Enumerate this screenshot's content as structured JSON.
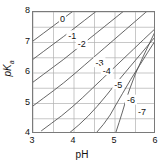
{
  "chart_data": {
    "type": "line",
    "title": "",
    "xlabel": "pH",
    "ylabel": "pKa",
    "ylabel_main": "pK",
    "ylabel_sub": "a",
    "xlim": [
      3,
      6
    ],
    "ylim": [
      4,
      8
    ],
    "xticks": [
      3,
      4,
      5,
      6
    ],
    "yticks": [
      4,
      5,
      6,
      7,
      8
    ],
    "xtick_labels": [
      "3",
      "4",
      "5",
      "6"
    ],
    "ytick_labels": [
      "4",
      "5",
      "6",
      "7",
      "8"
    ],
    "grid": true,
    "x_minor_step": 0.5,
    "y_minor_step": 0.5,
    "legend": "none",
    "plot_kind": "contour",
    "contour_labels": [
      "0",
      "-1",
      "-2",
      "-3",
      "-4",
      "-5",
      "-6",
      "-7"
    ],
    "contour_levels": [
      0,
      -1,
      -2,
      -3,
      -4,
      -5,
      -6,
      -7
    ],
    "label_positions": [
      {
        "label": "0",
        "pH": 3.72,
        "pKa": 7.78
      },
      {
        "label": "-1",
        "pH": 3.96,
        "pKa": 7.22
      },
      {
        "label": "-2",
        "pH": 4.19,
        "pKa": 6.94
      },
      {
        "label": "-3",
        "pH": 4.62,
        "pKa": 6.34
      },
      {
        "label": "-4",
        "pH": 4.8,
        "pKa": 6.08
      },
      {
        "label": "-5",
        "pH": 5.08,
        "pKa": 5.62
      },
      {
        "label": "-6",
        "pH": 5.39,
        "pKa": 5.11
      },
      {
        "label": "-7",
        "pH": 5.66,
        "pKa": 4.72
      }
    ],
    "series": [
      {
        "name": "0",
        "x": [
          3.0,
          3.25,
          3.5,
          3.75,
          4.0,
          4.25,
          4.5,
          4.75,
          5.0,
          5.25,
          5.5,
          5.75,
          6.0
        ],
        "y": [
          7.05,
          7.3,
          7.55,
          7.8,
          8.05,
          8.3,
          8.55,
          8.8,
          9.05,
          9.3,
          9.55,
          9.8,
          10.05
        ]
      },
      {
        "name": "-1",
        "x": [
          3.0,
          3.25,
          3.5,
          3.75,
          4.0,
          4.25,
          4.5,
          4.75,
          5.0,
          5.25,
          5.5,
          5.75,
          6.0
        ],
        "y": [
          6.45,
          6.7,
          6.95,
          7.2,
          7.46,
          7.72,
          7.98,
          8.24,
          8.5,
          8.76,
          9.02,
          9.28,
          9.54
        ]
      },
      {
        "name": "-2",
        "x": [
          3.0,
          3.25,
          3.5,
          3.75,
          4.0,
          4.25,
          4.5,
          4.75,
          5.0,
          5.25,
          5.5,
          5.75,
          6.0
        ],
        "y": [
          5.7,
          5.95,
          6.2,
          6.45,
          6.72,
          6.99,
          7.26,
          7.53,
          7.8,
          8.07,
          8.34,
          8.61,
          8.88
        ]
      },
      {
        "name": "-3",
        "x": [
          3.0,
          3.25,
          3.5,
          3.75,
          4.0,
          4.25,
          4.5,
          4.75,
          5.0,
          5.25,
          5.5,
          5.75,
          6.0
        ],
        "y": [
          4.92,
          5.17,
          5.42,
          5.68,
          5.96,
          6.25,
          6.54,
          6.83,
          7.12,
          7.41,
          7.7,
          7.99,
          8.28
        ]
      },
      {
        "name": "-4",
        "x": [
          3.2,
          3.45,
          3.7,
          3.95,
          4.2,
          4.45,
          4.7,
          4.95,
          5.2,
          5.45,
          5.7,
          6.0
        ],
        "y": [
          4.1,
          4.35,
          4.6,
          4.88,
          5.18,
          5.5,
          5.82,
          6.14,
          6.46,
          6.78,
          7.1,
          7.48
        ]
      },
      {
        "name": "-5",
        "x": [
          3.9,
          4.12,
          4.34,
          4.56,
          4.78,
          5.0,
          5.25,
          5.5,
          5.75,
          6.0
        ],
        "y": [
          4.05,
          4.3,
          4.58,
          4.9,
          5.25,
          5.62,
          6.02,
          6.42,
          6.82,
          7.22
        ]
      },
      {
        "name": "-6",
        "x": [
          4.55,
          4.72,
          4.88,
          5.02,
          5.18,
          5.38,
          5.6,
          5.8,
          6.0
        ],
        "y": [
          4.05,
          4.32,
          4.62,
          4.95,
          5.32,
          5.78,
          6.25,
          6.68,
          7.1
        ]
      },
      {
        "name": "-7",
        "x": [
          5.02,
          5.1,
          5.18,
          5.26,
          5.36,
          5.5,
          5.68,
          5.85,
          6.0
        ],
        "y": [
          4.05,
          4.38,
          4.72,
          5.08,
          5.48,
          5.98,
          6.52,
          7.0,
          7.42
        ]
      }
    ],
    "colors": {
      "contour": "#555555",
      "grid": "#b0b0b0",
      "axis": "#7a7a7a",
      "text": "#111111",
      "background": "#ffffff"
    }
  },
  "axes": {
    "x_title": "pH",
    "y_title_main": "pK",
    "y_title_sub": "a"
  }
}
